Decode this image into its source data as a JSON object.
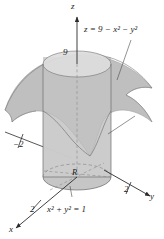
{
  "figure": {
    "surface_equation": {
      "lhs": "z",
      "eq": "=",
      "rhs": "9 − x² − y²",
      "full": "z = 9 − x² − y²"
    },
    "base_equation": {
      "full": "x² + y² = 1"
    },
    "region_label": "R",
    "axes": [
      {
        "name": "x",
        "label": "x",
        "direction": "front-left-down"
      },
      {
        "name": "y",
        "label": "y",
        "direction": "right"
      },
      {
        "name": "z",
        "label": "z",
        "direction": "up"
      }
    ],
    "tick_labels": [
      {
        "axis": "z",
        "value": "9"
      },
      {
        "axis": "y",
        "value": "2"
      },
      {
        "axis": "y-negative",
        "value": "−2"
      },
      {
        "axis": "x",
        "value": "2"
      }
    ],
    "colors": {
      "background": "#ffffff",
      "surface_fill": "#b9b9b9",
      "cylinder_fill": "#cfcfcf",
      "cylinder_top_fill": "#dedede",
      "base_disk_fill": "#c6c6c6",
      "outline": "#6f6f6f",
      "axis_line": "#2b2b2b",
      "dashed_line": "#8a8a8a",
      "text": "#1a1a1a"
    }
  }
}
